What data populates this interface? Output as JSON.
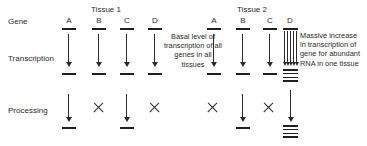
{
  "rows": {
    "gene_label": "Gene",
    "transcription_label": "Transcription",
    "processing_label": "Processing"
  },
  "tissues": [
    {
      "title": "Tissue 1",
      "genes": [
        {
          "letter": "A",
          "transcription": "single-arrow",
          "transcript": "single-bar",
          "processing": "single-arrow",
          "product": "single-bar"
        },
        {
          "letter": "B",
          "transcription": "single-arrow",
          "transcript": "single-bar",
          "processing": "blocked-x",
          "product": "none"
        },
        {
          "letter": "C",
          "transcription": "single-arrow",
          "transcript": "single-bar",
          "processing": "single-arrow",
          "product": "single-bar"
        },
        {
          "letter": "D",
          "transcription": "single-arrow",
          "transcript": "single-bar",
          "processing": "blocked-x",
          "product": "none"
        }
      ]
    },
    {
      "title": "Tissue 2",
      "genes": [
        {
          "letter": "A",
          "transcription": "single-arrow",
          "transcript": "single-bar",
          "processing": "blocked-x",
          "product": "none"
        },
        {
          "letter": "B",
          "transcription": "single-arrow",
          "transcript": "single-bar",
          "processing": "single-arrow",
          "product": "single-bar"
        },
        {
          "letter": "C",
          "transcription": "single-arrow",
          "transcript": "single-bar",
          "processing": "blocked-x",
          "product": "none"
        },
        {
          "letter": "D",
          "transcription": "arrow-bundle",
          "transcript": "rna-stack",
          "processing": "single-arrow",
          "product": "rna-stack"
        }
      ]
    }
  ],
  "annotations": {
    "center": "Basal level of transcription of all genes in all tissues",
    "right": "Massive increase in transcription of gene for abundant RNA in one tissue"
  },
  "colors": {
    "ink": "#1f1f1f",
    "text": "#2b2b2b",
    "background": "#ffffff"
  }
}
